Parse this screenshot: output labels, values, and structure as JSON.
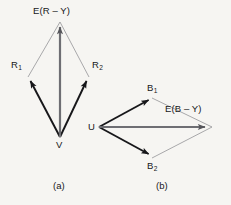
{
  "figure": {
    "background_color": "#f6f5f2",
    "ink_color": "#17171a",
    "resultant_color": "#6e6e73",
    "thin_line_color": "#8d8d92",
    "panels": [
      {
        "id": "a",
        "caption": "(a)",
        "caption_x": 53,
        "caption_y": 181,
        "origin_label": "V",
        "resultant_label_text": "E(R",
        "resultant_label_minus": "–",
        "resultant_label_tail": "Y)",
        "resultant_label_full": "E(R – Y)",
        "components": [
          {
            "name": "R",
            "sub": "1"
          },
          {
            "name": "R",
            "sub": "2"
          }
        ],
        "geometry": {
          "origin": [
            60,
            137
          ],
          "resultant_tip": [
            60,
            22
          ],
          "component1_tip": [
            28,
            77
          ],
          "component2_tip": [
            89,
            77
          ]
        },
        "labels": {
          "origin": {
            "x": 56,
            "y": 140
          },
          "resultant": {
            "x": 33,
            "y": 6
          },
          "component1": {
            "x": 11,
            "y": 60
          },
          "component2": {
            "x": 92,
            "y": 60
          }
        }
      },
      {
        "id": "b",
        "caption": "(b)",
        "caption_x": 156,
        "caption_y": 181,
        "origin_label": "U",
        "resultant_label_text": "E(B",
        "resultant_label_minus": "–",
        "resultant_label_tail": "Y)",
        "resultant_label_full": "E(B – Y)",
        "components": [
          {
            "name": "B",
            "sub": "1"
          },
          {
            "name": "B",
            "sub": "2"
          }
        ],
        "geometry": {
          "origin": [
            99,
            127
          ],
          "resultant_tip": [
            212,
            127
          ],
          "component1_tip": [
            152,
            98
          ],
          "component2_tip": [
            152,
            158
          ]
        },
        "labels": {
          "origin": {
            "x": 88,
            "y": 122
          },
          "resultant": {
            "x": 165,
            "y": 104
          },
          "component1": {
            "x": 147,
            "y": 83
          },
          "component2": {
            "x": 147,
            "y": 161
          }
        }
      }
    ]
  }
}
